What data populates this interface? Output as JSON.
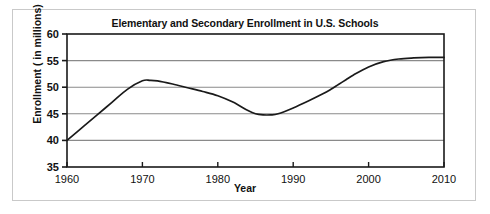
{
  "figure": {
    "background_color": "#ffffff",
    "frame_color": "#c9c9c9"
  },
  "chart_data": {
    "type": "line",
    "title": "Elementary and Secondary Enrollment in U.S. Schools",
    "subtitle": "",
    "xlabel": "Year",
    "ylabel": "Enrollment ( in millions)",
    "xlim": [
      1960,
      2010
    ],
    "ylim": [
      35,
      60
    ],
    "xticks": [
      1960,
      1970,
      1980,
      1990,
      2000,
      2010
    ],
    "xtick_labels": [
      "1960",
      "1970",
      "1980",
      "1990",
      "2000",
      "2010"
    ],
    "yticks": [
      35,
      40,
      45,
      50,
      55,
      60
    ],
    "ytick_labels": [
      "35",
      "40",
      "45",
      "50",
      "55",
      "60"
    ],
    "grid": "horizontal",
    "grid_color": "#8a8a8a",
    "legend": "none",
    "line_color": "#1a1a1a",
    "line_width": 1.6,
    "x": [
      1960,
      1962,
      1964,
      1966,
      1968,
      1970,
      1971,
      1972,
      1974,
      1976,
      1978,
      1980,
      1982,
      1984,
      1985,
      1986,
      1987,
      1988,
      1990,
      1992,
      1994,
      1995,
      1996,
      1997,
      1998,
      2000,
      2002,
      2004,
      2006,
      2008,
      2010
    ],
    "values": [
      40.0,
      42.4,
      44.8,
      47.2,
      49.6,
      51.2,
      51.3,
      51.2,
      50.6,
      49.9,
      49.2,
      48.4,
      47.2,
      45.6,
      45.0,
      44.8,
      44.8,
      45.0,
      46.1,
      47.4,
      48.8,
      49.6,
      50.5,
      51.4,
      52.3,
      53.8,
      54.8,
      55.3,
      55.5,
      55.6,
      55.6
    ],
    "annotations": []
  }
}
